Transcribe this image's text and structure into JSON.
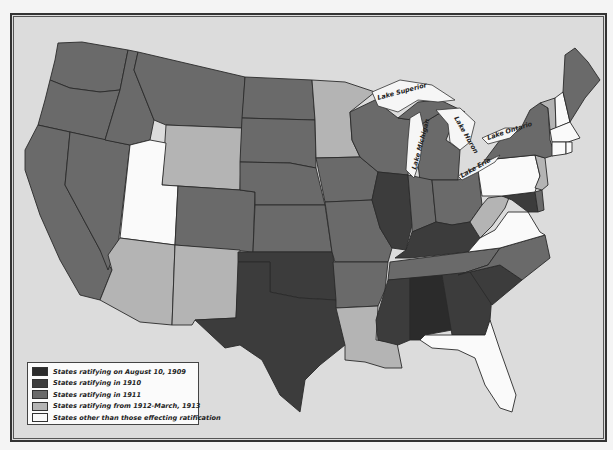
{
  "map": {
    "subject": "Ratification of the Sixteenth Amendment (income tax) by state",
    "categories": {
      "c1909": {
        "label": "States ratifying on August 10, 1909",
        "color": "#2b2b2b"
      },
      "c1910": {
        "label": "States ratifying in 1910",
        "color": "#3c3c3c"
      },
      "c1911": {
        "label": "States ratifying in 1911",
        "color": "#6a6a6a"
      },
      "c1912": {
        "label": "States ratifying from 1912-March, 1913",
        "color": "#b4b4b4"
      },
      "cnone": {
        "label": "States other than those effecting ratification",
        "color": "#fafafa"
      }
    },
    "lakes": [
      {
        "name": "Lake Superior",
        "label": "Lake Superior"
      },
      {
        "name": "Lake Michigan",
        "label": "Lake Michigan"
      },
      {
        "name": "Lake Huron",
        "label": "Lake Huron"
      },
      {
        "name": "Lake Erie",
        "label": "Lake Erie"
      },
      {
        "name": "Lake Ontario",
        "label": "Lake Ontario"
      }
    ],
    "states": {
      "WA": "c1911",
      "OR": "c1911",
      "CA": "c1911",
      "NV": "c1911",
      "ID": "c1911",
      "MT": "c1911",
      "WY": "c1912",
      "UT": "cnone",
      "CO": "c1911",
      "AZ": "c1912",
      "NM": "c1912",
      "ND": "c1911",
      "SD": "c1911",
      "NE": "c1911",
      "KS": "c1911",
      "OK": "c1910",
      "TX": "c1910",
      "MN": "c1912",
      "IA": "c1911",
      "MO": "c1911",
      "AR": "c1911",
      "LA": "c1912",
      "WI": "c1911",
      "IL": "c1910",
      "MI": "c1911",
      "IN": "c1911",
      "OH": "c1911",
      "KY": "c1910",
      "TN": "c1911",
      "MS": "c1910",
      "AL": "c1909",
      "GA": "c1910",
      "FL": "cnone",
      "SC": "c1910",
      "NC": "c1911",
      "VA": "cnone",
      "WV": "c1912",
      "MD": "c1910",
      "DE": "c1911",
      "PA": "cnone",
      "NJ": "c1912",
      "NY": "c1911",
      "VT": "c1912",
      "NH": "cnone",
      "ME": "c1911",
      "MA": "cnone",
      "CT": "cnone",
      "RI": "cnone"
    }
  },
  "legend": {
    "items": [
      {
        "key": "c1909",
        "label": "States ratifying on August 10, 1909"
      },
      {
        "key": "c1910",
        "label": "States ratifying in 1910"
      },
      {
        "key": "c1911",
        "label": "States ratifying in 1911"
      },
      {
        "key": "c1912",
        "label": "States ratifying from 1912-March, 1913"
      },
      {
        "key": "cnone",
        "label": "States other than those effecting ratification"
      }
    ]
  }
}
